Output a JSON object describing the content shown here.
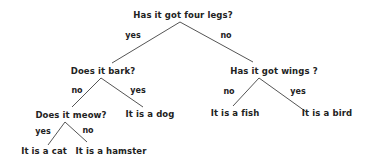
{
  "diagram": {
    "type": "decision-tree",
    "nodes": {
      "root": {
        "label": "Has it got four legs?",
        "x": 183,
        "y": 15
      },
      "bark": {
        "label": "Does it bark?",
        "x": 103,
        "y": 71
      },
      "wings": {
        "label": "Has it got wings ?",
        "x": 274,
        "y": 71
      },
      "meow": {
        "label": "Does it meow?",
        "x": 71,
        "y": 115
      },
      "dog": {
        "label": "It is a dog",
        "x": 150,
        "y": 114
      },
      "fish": {
        "label": "It is a fish",
        "x": 235,
        "y": 113
      },
      "bird": {
        "label": "It is a bird",
        "x": 327,
        "y": 113
      },
      "cat": {
        "label": "It is a cat",
        "x": 44,
        "y": 151
      },
      "hamster": {
        "label": "It is a hamster",
        "x": 111,
        "y": 151
      }
    },
    "edges": [
      {
        "from": "root",
        "to": "bark",
        "label": "yes",
        "x1": 180,
        "y1": 22,
        "x2": 112,
        "y2": 63,
        "lx": 133,
        "ly": 35
      },
      {
        "from": "root",
        "to": "wings",
        "label": "no",
        "x1": 180,
        "y1": 22,
        "x2": 253,
        "y2": 62,
        "lx": 226,
        "ly": 35
      },
      {
        "from": "bark",
        "to": "meow",
        "label": "no",
        "x1": 101,
        "y1": 78,
        "x2": 72,
        "y2": 107,
        "lx": 77,
        "ly": 90
      },
      {
        "from": "bark",
        "to": "dog",
        "label": "yes",
        "x1": 101,
        "y1": 78,
        "x2": 143,
        "y2": 107,
        "lx": 138,
        "ly": 90
      },
      {
        "from": "wings",
        "to": "fish",
        "label": "no",
        "x1": 259,
        "y1": 78,
        "x2": 233,
        "y2": 106,
        "lx": 229,
        "ly": 91
      },
      {
        "from": "wings",
        "to": "bird",
        "label": "yes",
        "x1": 259,
        "y1": 78,
        "x2": 305,
        "y2": 111,
        "lx": 298,
        "ly": 91
      },
      {
        "from": "meow",
        "to": "cat",
        "label": "yes",
        "x1": 65,
        "y1": 122,
        "x2": 48,
        "y2": 145,
        "lx": 43,
        "ly": 131
      },
      {
        "from": "meow",
        "to": "hamster",
        "label": "no",
        "x1": 65,
        "y1": 122,
        "x2": 87,
        "y2": 142,
        "lx": 88,
        "ly": 130
      }
    ]
  }
}
